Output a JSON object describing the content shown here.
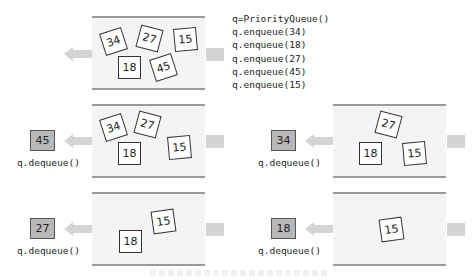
{
  "code": {
    "lines": [
      "q=PriorityQueue()",
      "q.enqueue(34)",
      "q.enqueue(18)",
      "q.enqueue(27)",
      "q.enqueue(45)",
      "q.enqueue(15)"
    ]
  },
  "panels": {
    "initial": {
      "items": [
        "34",
        "27",
        "15",
        "18",
        "45"
      ]
    },
    "step1": {
      "output": "45",
      "label": "q.dequeue()",
      "items": [
        "34",
        "27",
        "18",
        "15"
      ]
    },
    "step2": {
      "output": "34",
      "label": "q.dequeue()",
      "items": [
        "27",
        "18",
        "15"
      ]
    },
    "step3": {
      "output": "27",
      "label": "q.dequeue()",
      "items": [
        "15",
        "18"
      ]
    },
    "step4": {
      "output": "18",
      "label": "q.dequeue()",
      "items": [
        "15"
      ]
    }
  },
  "colors": {
    "queue_bg": "#f4f4f4",
    "queue_border": "#9a9a9a",
    "arrow": "#d4d4d4",
    "output_box": "#b8b8b8"
  }
}
